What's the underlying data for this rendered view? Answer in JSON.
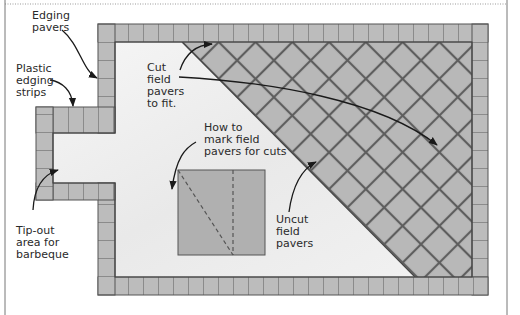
{
  "diagram": {
    "type": "paver patio layout",
    "colors": {
      "paver_fill": "#b9b9b9",
      "paver_grout": "#5a5a5a",
      "field_bg": "#efefef",
      "outline": "#444444",
      "text": "#2a2a2a"
    },
    "labels": {
      "edging_pavers": "Edging\npavers",
      "plastic_edging": "Plastic\nedging\nstrips",
      "tip_out": "Tip-out\narea for\nbarbeque",
      "cut_field": "Cut\nfield\npavers\nto fit.",
      "how_to_mark": "How to\nmark field\npavers for cuts",
      "uncut_field": "Uncut\nfield\npavers"
    }
  }
}
